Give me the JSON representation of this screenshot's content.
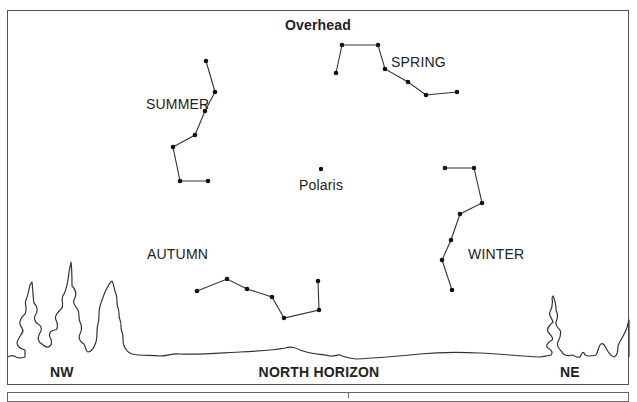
{
  "title": "Overhead",
  "horizon": {
    "label": "NORTH HORIZON",
    "left_label": "NW",
    "right_label": "NE"
  },
  "center_star": {
    "label": "Polaris",
    "point": [
      321,
      169
    ]
  },
  "constellations": [
    {
      "season": "SPRING",
      "label_pos": [
        391,
        54
      ],
      "points": [
        [
          336,
          73
        ],
        [
          342,
          45
        ],
        [
          378,
          45
        ],
        [
          385,
          69
        ],
        [
          408,
          82
        ],
        [
          426,
          95
        ],
        [
          457,
          92
        ]
      ]
    },
    {
      "season": "SUMMER",
      "label_pos": [
        146,
        96
      ],
      "points": [
        [
          206,
          61
        ],
        [
          215,
          92
        ],
        [
          205,
          111
        ],
        [
          195,
          135
        ],
        [
          173,
          147
        ],
        [
          180,
          181
        ],
        [
          208,
          181
        ]
      ]
    },
    {
      "season": "WINTER",
      "label_pos": [
        468,
        246
      ],
      "points": [
        [
          445,
          168
        ],
        [
          474,
          168
        ],
        [
          482,
          203
        ],
        [
          460,
          214
        ],
        [
          451,
          240
        ],
        [
          442,
          260
        ],
        [
          452,
          290
        ]
      ]
    },
    {
      "season": "AUTUMN",
      "label_pos": [
        147,
        246
      ],
      "points": [
        [
          197,
          291
        ],
        [
          227,
          279
        ],
        [
          247,
          289
        ],
        [
          272,
          297
        ],
        [
          284,
          318
        ],
        [
          319,
          310
        ],
        [
          318,
          281
        ]
      ]
    }
  ],
  "colors": {
    "line": "#222222",
    "frame": "#555555",
    "background": "#ffffff"
  }
}
